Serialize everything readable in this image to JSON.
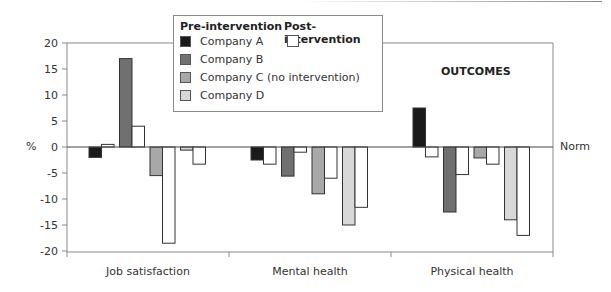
{
  "chart_data": {
    "type": "bar",
    "title": "OUTCOMES",
    "xlabel": "",
    "ylabel": "%",
    "ylim": [
      -20,
      20
    ],
    "yticks": [
      20,
      15,
      10,
      5,
      0,
      -5,
      -10,
      -15,
      -20
    ],
    "reference_line": {
      "value": 0,
      "label": "Norm"
    },
    "grid": false,
    "legend_position": "top-center (inset box)",
    "categories": [
      "Job satisfaction",
      "Mental health",
      "Physical health"
    ],
    "series": [
      {
        "name": "Company A",
        "phase": "Pre-intervention",
        "color": "#1a1a1a",
        "values": [
          -2,
          -2.5,
          7.5
        ]
      },
      {
        "name": "Company A",
        "phase": "Post-intervention",
        "color": "#ffffff",
        "values": [
          0.5,
          -3.3,
          -1.9
        ]
      },
      {
        "name": "Company B",
        "phase": "Pre-intervention",
        "color": "#707070",
        "values": [
          17,
          -5.6,
          -12.5
        ]
      },
      {
        "name": "Company B",
        "phase": "Post-intervention",
        "color": "#ffffff",
        "values": [
          4,
          -1,
          -5.3
        ]
      },
      {
        "name": "Company C (no intervention)",
        "phase": "Pre-intervention",
        "color": "#a8a8a8",
        "values": [
          -5.5,
          -9,
          -2.1
        ]
      },
      {
        "name": "Company C (no intervention)",
        "phase": "Post-intervention",
        "color": "#ffffff",
        "values": [
          -18.5,
          -6,
          -3.3
        ]
      },
      {
        "name": "Company D",
        "phase": "Pre-intervention",
        "color": "#d8d8d8",
        "values": [
          -0.6,
          -15,
          -14
        ]
      },
      {
        "name": "Company D",
        "phase": "Post-intervention",
        "color": "#ffffff",
        "values": [
          -3.3,
          -11.6,
          -17
        ]
      }
    ]
  },
  "legend": {
    "pre_header": "Pre-intervention",
    "post_header": "Post-intervention",
    "items": [
      {
        "label": "Company A",
        "color": "#1a1a1a"
      },
      {
        "label": "Company B",
        "color": "#707070"
      },
      {
        "label": "Company C (no intervention)",
        "color": "#a8a8a8"
      },
      {
        "label": "Company D",
        "color": "#d8d8d8"
      }
    ],
    "post_color": "#ffffff"
  },
  "labels": {
    "outcomes": "OUTCOMES",
    "y_unit": "%",
    "norm": "Norm"
  }
}
